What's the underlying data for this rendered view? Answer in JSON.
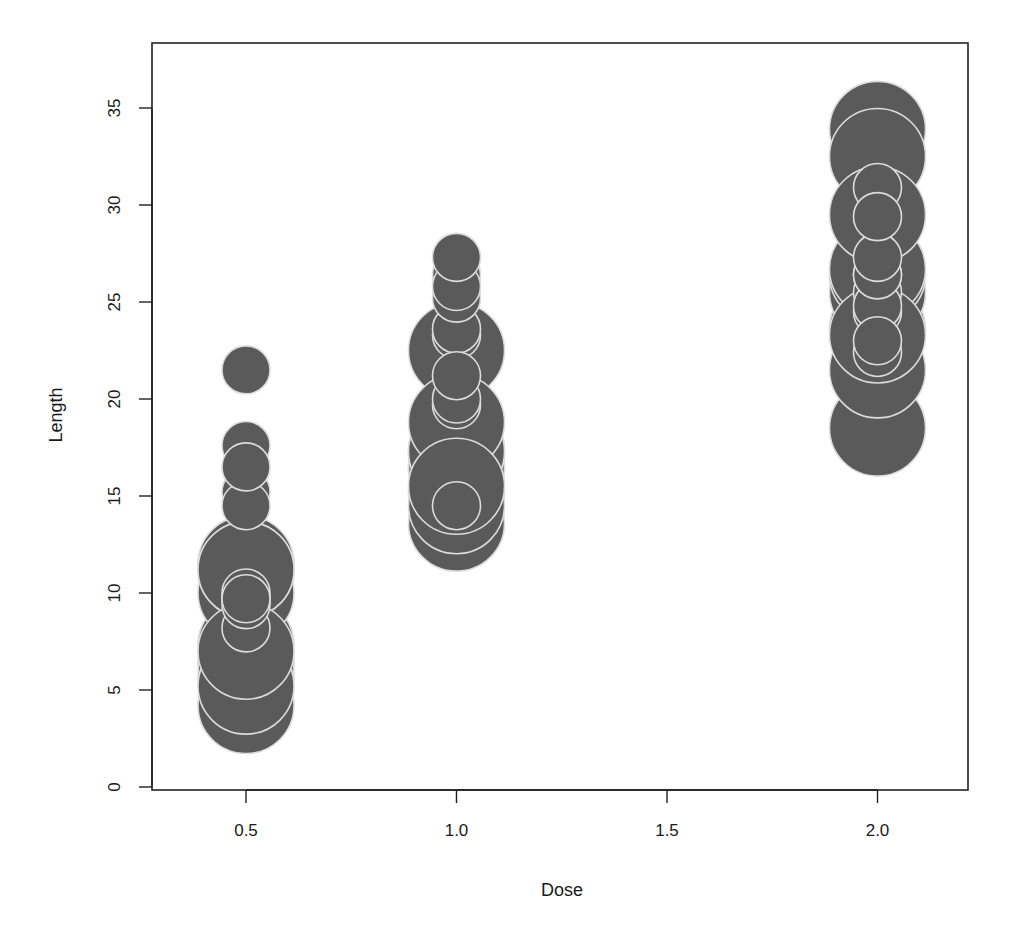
{
  "chart_data": {
    "type": "scatter",
    "subtype": "bubble",
    "title": "",
    "xlabel": "Dose",
    "ylabel": "Length",
    "xlim": [
      0.28,
      2.22
    ],
    "ylim": [
      0,
      38
    ],
    "x_ticks": [
      0.5,
      1.0,
      1.5,
      2.0
    ],
    "x_tick_labels": [
      "0.5",
      "1.0",
      "1.5",
      "2.0"
    ],
    "y_ticks": [
      0,
      5,
      10,
      15,
      20,
      25,
      30,
      35
    ],
    "y_tick_labels": [
      "0",
      "5",
      "10",
      "15",
      "20",
      "25",
      "30",
      "35"
    ],
    "grid": false,
    "legend": null,
    "colors": {
      "fill": "#5a5a5a",
      "outline": "#dcdcdc",
      "axis": "#222222"
    },
    "series": [
      {
        "name": "large bubbles",
        "bubble_radius_px": 48,
        "points": [
          {
            "x": 0.5,
            "y": 4.2
          },
          {
            "x": 0.5,
            "y": 11.5
          },
          {
            "x": 0.5,
            "y": 7.3
          },
          {
            "x": 0.5,
            "y": 5.8
          },
          {
            "x": 0.5,
            "y": 6.4
          },
          {
            "x": 0.5,
            "y": 10.0
          },
          {
            "x": 0.5,
            "y": 11.2
          },
          {
            "x": 0.5,
            "y": 11.2
          },
          {
            "x": 0.5,
            "y": 5.2
          },
          {
            "x": 0.5,
            "y": 7.0
          },
          {
            "x": 1.0,
            "y": 16.5
          },
          {
            "x": 1.0,
            "y": 16.5
          },
          {
            "x": 1.0,
            "y": 15.2
          },
          {
            "x": 1.0,
            "y": 17.3
          },
          {
            "x": 1.0,
            "y": 22.5
          },
          {
            "x": 1.0,
            "y": 17.3
          },
          {
            "x": 1.0,
            "y": 13.6
          },
          {
            "x": 1.0,
            "y": 14.5
          },
          {
            "x": 1.0,
            "y": 18.8
          },
          {
            "x": 1.0,
            "y": 15.5
          },
          {
            "x": 2.0,
            "y": 23.6
          },
          {
            "x": 2.0,
            "y": 18.5
          },
          {
            "x": 2.0,
            "y": 33.9
          },
          {
            "x": 2.0,
            "y": 25.5
          },
          {
            "x": 2.0,
            "y": 26.4
          },
          {
            "x": 2.0,
            "y": 32.5
          },
          {
            "x": 2.0,
            "y": 26.7
          },
          {
            "x": 2.0,
            "y": 21.5
          },
          {
            "x": 2.0,
            "y": 23.3
          },
          {
            "x": 2.0,
            "y": 29.5
          }
        ]
      },
      {
        "name": "small bubbles",
        "bubble_radius_px": 24,
        "points": [
          {
            "x": 0.5,
            "y": 15.2
          },
          {
            "x": 0.5,
            "y": 21.5
          },
          {
            "x": 0.5,
            "y": 17.6
          },
          {
            "x": 0.5,
            "y": 9.7
          },
          {
            "x": 0.5,
            "y": 14.5
          },
          {
            "x": 0.5,
            "y": 10.0
          },
          {
            "x": 0.5,
            "y": 8.2
          },
          {
            "x": 0.5,
            "y": 9.4
          },
          {
            "x": 0.5,
            "y": 16.5
          },
          {
            "x": 0.5,
            "y": 9.7
          },
          {
            "x": 1.0,
            "y": 19.7
          },
          {
            "x": 1.0,
            "y": 23.3
          },
          {
            "x": 1.0,
            "y": 23.6
          },
          {
            "x": 1.0,
            "y": 26.4
          },
          {
            "x": 1.0,
            "y": 20.0
          },
          {
            "x": 1.0,
            "y": 25.2
          },
          {
            "x": 1.0,
            "y": 25.8
          },
          {
            "x": 1.0,
            "y": 21.2
          },
          {
            "x": 1.0,
            "y": 14.5
          },
          {
            "x": 1.0,
            "y": 27.3
          },
          {
            "x": 2.0,
            "y": 25.5
          },
          {
            "x": 2.0,
            "y": 26.4
          },
          {
            "x": 2.0,
            "y": 22.4
          },
          {
            "x": 2.0,
            "y": 24.5
          },
          {
            "x": 2.0,
            "y": 24.8
          },
          {
            "x": 2.0,
            "y": 30.9
          },
          {
            "x": 2.0,
            "y": 26.4
          },
          {
            "x": 2.0,
            "y": 27.3
          },
          {
            "x": 2.0,
            "y": 29.4
          },
          {
            "x": 2.0,
            "y": 23.0
          }
        ]
      }
    ]
  }
}
